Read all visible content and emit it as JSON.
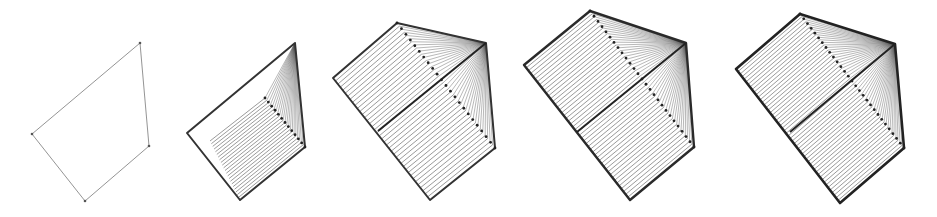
{
  "figure": {
    "background": "#ffffff",
    "stroke_color": "#333333",
    "hatch_color": "#555555",
    "panels": [
      {
        "id": "panel-1",
        "outline": [
          [
            32,
            134
          ],
          [
            140,
            43
          ],
          [
            149,
            146
          ],
          [
            85,
            201
          ]
        ],
        "outline_width": 0.9,
        "outline_color": "#888888",
        "vertex_dots": true,
        "hatch": null,
        "fan": null,
        "diagonal": null,
        "dotted": null
      },
      {
        "id": "panel-2",
        "outline": [
          [
            187,
            133
          ],
          [
            295,
            43
          ],
          [
            305,
            147
          ],
          [
            240,
            200
          ]
        ],
        "outline_width": 2,
        "outline_color": "#333333",
        "vertex_dots": false,
        "hatch": {
          "a0": [
            210,
            141
          ],
          "a1": [
            240,
            200
          ],
          "b0": [
            265,
            98
          ],
          "b1": [
            305,
            147
          ],
          "count": 22
        },
        "fan": {
          "apex": [
            295,
            43
          ],
          "from0": [
            265,
            98
          ],
          "from1": [
            305,
            147
          ],
          "count": 22
        },
        "diagonal": null,
        "dotted": {
          "p0": [
            265,
            98
          ],
          "p1": [
            305,
            147
          ],
          "count": 12
        }
      },
      {
        "id": "panel-3",
        "outline": [
          [
            333,
            78
          ],
          [
            397,
            23
          ],
          [
            486,
            43
          ],
          [
            495,
            148
          ],
          [
            430,
            200
          ]
        ],
        "outline_width": 2,
        "outline_color": "#333333",
        "vertex_dots": false,
        "hatch": {
          "a0": [
            333,
            78
          ],
          "a1": [
            430,
            200
          ],
          "b0": [
            397,
            23
          ],
          "b1": [
            495,
            148
          ],
          "count": 40
        },
        "fan": {
          "apex": [
            486,
            43
          ],
          "from0": [
            397,
            23
          ],
          "from1": [
            495,
            148
          ],
          "count": 40
        },
        "diagonal": {
          "p0": [
            378,
            131
          ],
          "p1": [
            486,
            43
          ]
        },
        "dotted": {
          "p0": [
            397,
            23
          ],
          "p1": [
            495,
            148
          ],
          "count": 22
        }
      },
      {
        "id": "panel-4",
        "outline": [
          [
            524,
            65
          ],
          [
            590,
            11
          ],
          [
            686,
            43
          ],
          [
            694,
            147
          ],
          [
            630,
            200
          ]
        ],
        "outline_width": 2.4,
        "outline_color": "#2a2a2a",
        "vertex_dots": false,
        "hatch": {
          "a0": [
            524,
            65
          ],
          "a1": [
            630,
            200
          ],
          "b0": [
            590,
            11
          ],
          "b1": [
            694,
            147
          ],
          "count": 48
        },
        "fan": {
          "apex": [
            686,
            43
          ],
          "from0": [
            590,
            11
          ],
          "from1": [
            694,
            147
          ],
          "count": 48
        },
        "diagonal": {
          "p0": [
            577,
            132
          ],
          "p1": [
            686,
            43
          ]
        },
        "dotted": {
          "p0": [
            590,
            11
          ],
          "p1": [
            694,
            147
          ],
          "count": 26
        }
      },
      {
        "id": "panel-5",
        "outline": [
          [
            736,
            69
          ],
          [
            800,
            14
          ],
          [
            895,
            44
          ],
          [
            904,
            148
          ],
          [
            840,
            203
          ]
        ],
        "outline_width": 2.6,
        "outline_color": "#222222",
        "vertex_dots": false,
        "hatch": {
          "a0": [
            736,
            69
          ],
          "a1": [
            840,
            203
          ],
          "b0": [
            800,
            14
          ],
          "b1": [
            904,
            148
          ],
          "count": 52
        },
        "fan": {
          "apex": [
            895,
            44
          ],
          "from0": [
            800,
            14
          ],
          "from1": [
            904,
            148
          ],
          "count": 52
        },
        "diagonal": {
          "p0": [
            790,
            132
          ],
          "p1": [
            895,
            44
          ]
        },
        "dotted": {
          "p0": [
            800,
            14
          ],
          "p1": [
            904,
            148
          ],
          "count": 28
        }
      }
    ]
  }
}
